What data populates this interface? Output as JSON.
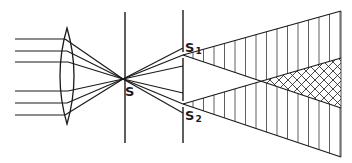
{
  "diagram": {
    "labels": {
      "source": "S",
      "slit1": "S",
      "slit1_sub": "1",
      "slit2": "S",
      "slit2_sub": "2"
    },
    "colors": {
      "ink": "#1a1a1a",
      "background": "#ffffff"
    }
  }
}
